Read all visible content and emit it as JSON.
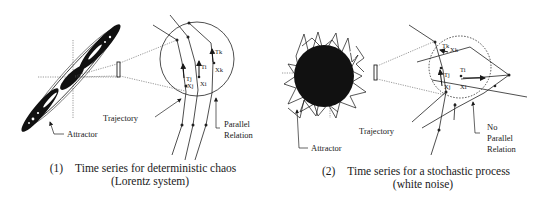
{
  "panels": [
    {
      "id": "deterministic",
      "number": "(1)",
      "caption_line1": "Time series for deterministic chaos",
      "caption_line2": "(Lorentz system)",
      "labels": {
        "attractor": "Attractor",
        "trajectory": "Trajectory",
        "relation_line1": "Parallel",
        "relation_line2": "Relation"
      },
      "vectors": [
        {
          "tangent": "Tj",
          "point": "Xj"
        },
        {
          "tangent": "Ti",
          "point": "Xi"
        },
        {
          "tangent": "Tk",
          "point": "Xk"
        }
      ],
      "neighborhood_style": "solid"
    },
    {
      "id": "stochastic",
      "number": "(2)",
      "caption_line1": "Time series for a stochastic process",
      "caption_line2": "(white noise)",
      "labels": {
        "attractor": "Attractor",
        "trajectory": "Trajectory",
        "relation_line1": "No",
        "relation_line2": "Parallel",
        "relation_line3": "Relation"
      },
      "vectors": [
        {
          "tangent": "Tk",
          "point": "Xk"
        },
        {
          "tangent": "Tj",
          "point": "Xj"
        },
        {
          "tangent": "Ti",
          "point": "Xi"
        }
      ],
      "neighborhood_style": "dashed"
    }
  ],
  "colors": {
    "ink": "#1a1a1a",
    "background": "#ffffff"
  }
}
